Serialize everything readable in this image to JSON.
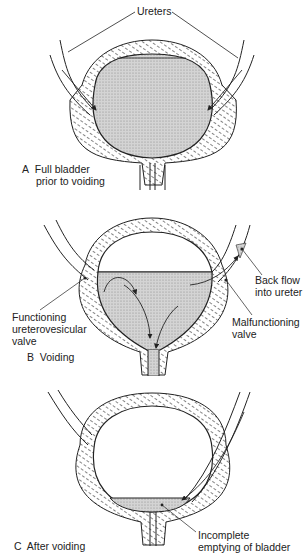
{
  "figure": {
    "panels": [
      {
        "id": "A",
        "caption_letter": "A",
        "caption_lines": [
          "Full bladder",
          "prior to voiding"
        ],
        "labels": [
          {
            "id": "ureters",
            "text": "Ureters"
          }
        ]
      },
      {
        "id": "B",
        "caption_letter": "B",
        "caption_lines": [
          "Voiding"
        ],
        "labels": [
          {
            "id": "functioning-valve",
            "lines": [
              "Functioning",
              "ureterovesicular",
              "valve"
            ]
          },
          {
            "id": "back-flow",
            "lines": [
              "Back flow",
              "into ureter"
            ]
          },
          {
            "id": "malfunctioning-valve",
            "lines": [
              "Malfunctioning",
              "valve"
            ]
          }
        ]
      },
      {
        "id": "C",
        "caption_letter": "C",
        "caption_lines": [
          "After voiding"
        ],
        "labels": [
          {
            "id": "incomplete-emptying",
            "lines": [
              "Incomplete",
              "emptying of bladder"
            ]
          }
        ]
      }
    ],
    "colors": {
      "line": "#222222",
      "urine_fill": "#c9c9c9",
      "wall_hatch": "#777777",
      "background": "#ffffff"
    }
  }
}
